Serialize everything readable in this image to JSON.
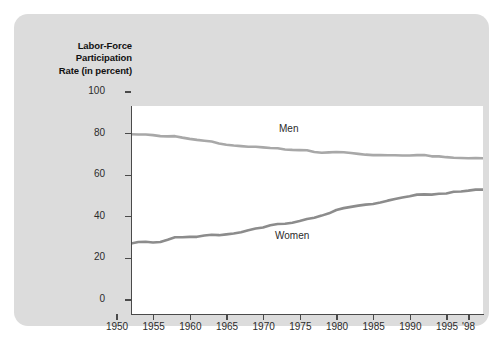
{
  "figure": {
    "background_color": "#dcdcdc",
    "plot_background_color": "#ffffff"
  },
  "axis_title": {
    "line1": "Labor-Force",
    "line2": "Participation",
    "line3": "Rate (in percent)"
  },
  "chart_data": {
    "type": "line",
    "title": "Labor-Force Participation Rate (in percent)",
    "xlabel": "",
    "ylabel": "Labor-Force Participation Rate (in percent)",
    "xlim": [
      1950,
      1998
    ],
    "ylim": [
      0,
      100
    ],
    "grid": false,
    "legend": "inline-annotation",
    "ytick_labels": [
      "0",
      "20",
      "40",
      "60",
      "80",
      "100"
    ],
    "ytick_values": [
      0,
      20,
      40,
      60,
      80,
      100
    ],
    "xtick_labels": [
      "1950",
      "1955",
      "1960",
      "1965",
      "1970",
      "1975",
      "1980",
      "1985",
      "1990",
      "1995",
      "'98"
    ],
    "xtick_values": [
      1950,
      1955,
      1960,
      1965,
      1970,
      1975,
      1980,
      1985,
      1990,
      1995,
      1998
    ],
    "x": [
      1950,
      1951,
      1952,
      1953,
      1954,
      1955,
      1956,
      1957,
      1958,
      1959,
      1960,
      1961,
      1962,
      1963,
      1964,
      1965,
      1966,
      1967,
      1968,
      1969,
      1970,
      1971,
      1972,
      1973,
      1974,
      1975,
      1976,
      1977,
      1978,
      1979,
      1980,
      1981,
      1982,
      1983,
      1984,
      1985,
      1986,
      1987,
      1988,
      1989,
      1990,
      1991,
      1992,
      1993,
      1994,
      1995,
      1996,
      1997,
      1998
    ],
    "series": [
      {
        "name": "Men",
        "color": "#a8a8a8",
        "label_x": 1977,
        "label_y": 86,
        "values": [
          86.4,
          86.3,
          86.3,
          86.0,
          85.5,
          85.4,
          85.5,
          84.8,
          84.2,
          83.7,
          83.3,
          82.9,
          82.0,
          81.4,
          81.0,
          80.7,
          80.4,
          80.4,
          80.1,
          79.8,
          79.7,
          79.1,
          78.9,
          78.8,
          78.7,
          77.9,
          77.5,
          77.7,
          77.9,
          77.8,
          77.4,
          77.0,
          76.6,
          76.4,
          76.4,
          76.3,
          76.3,
          76.2,
          76.2,
          76.4,
          76.4,
          75.8,
          75.8,
          75.4,
          75.1,
          75.0,
          74.9,
          75.0,
          74.9
        ]
      },
      {
        "name": "Women",
        "color": "#8c8c8c",
        "label_x": 1975,
        "label_y": 40,
        "values": [
          33.9,
          34.6,
          34.7,
          34.4,
          34.6,
          35.7,
          36.9,
          36.9,
          37.1,
          37.1,
          37.7,
          38.1,
          37.9,
          38.3,
          38.7,
          39.3,
          40.3,
          41.1,
          41.6,
          42.7,
          43.3,
          43.4,
          43.9,
          44.7,
          45.7,
          46.3,
          47.3,
          48.4,
          50.0,
          50.9,
          51.5,
          52.1,
          52.6,
          52.9,
          53.6,
          54.5,
          55.3,
          56.0,
          56.6,
          57.4,
          57.5,
          57.4,
          57.8,
          57.9,
          58.8,
          58.9,
          59.3,
          59.8,
          59.8
        ]
      }
    ]
  }
}
